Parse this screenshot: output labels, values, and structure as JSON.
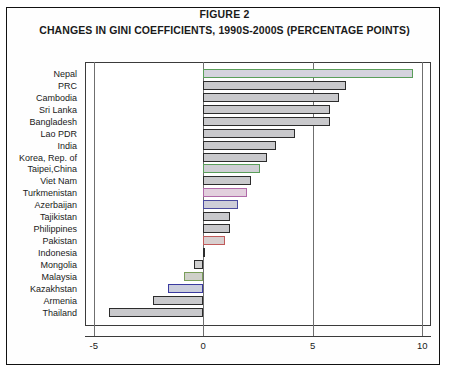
{
  "figure": {
    "label": "FIGURE 2",
    "title": "CHANGES IN GINI COEFFICIENTS, 1990S-2000S (PERCENTAGE POINTS)"
  },
  "axis": {
    "ticks": [
      "-5",
      "0",
      "5",
      "10"
    ],
    "tick_values": [
      -5,
      0,
      5,
      10
    ]
  },
  "chart_data": {
    "type": "bar",
    "orientation": "horizontal",
    "title": "CHANGES IN GINI COEFFICIENTS, 1990S-2000S (PERCENTAGE POINTS)",
    "subtitle": "FIGURE 2",
    "xlabel": "",
    "ylabel": "",
    "xlim": [
      -5.4,
      10.4
    ],
    "grid": true,
    "legend": "none",
    "categories": [
      "Nepal",
      "PRC",
      "Cambodia",
      "Sri Lanka",
      "Bangladesh",
      "Lao PDR",
      "India",
      "Korea, Rep. of",
      "Taipei,China",
      "Viet Nam",
      "Turkmenistan",
      "Azerbaijan",
      "Tajikistan",
      "Philippines",
      "Pakistan",
      "Indonesia",
      "Mongolia",
      "Malaysia",
      "Kazakhstan",
      "Armenia",
      "Thailand"
    ],
    "values": [
      9.6,
      6.5,
      6.2,
      5.8,
      5.8,
      4.2,
      3.3,
      2.9,
      2.6,
      2.2,
      2.0,
      1.6,
      1.2,
      1.2,
      1.0,
      0.1,
      -0.4,
      -0.9,
      -1.6,
      -2.3,
      -4.3
    ],
    "bar_colors": [
      "#d5d3de",
      "#c9c9cc",
      "#c9c9cc",
      "#c9c9cc",
      "#c9c9cc",
      "#c9c9cc",
      "#c9c9cc",
      "#c9c9cc",
      "#cfcfd4",
      "#c9c9cc",
      "#e2cfdd",
      "#cdcdd8",
      "#c9c9cc",
      "#c9c9cc",
      "#d8cfcf",
      "#6b6b6b",
      "#d0d0d0",
      "#cfd0c9",
      "#cbcedd",
      "#c9c9cc",
      "#c9c9cc"
    ],
    "bar_border_colors": [
      "#5a9e5a",
      "#2c2c2c",
      "#2c2c2c",
      "#2c2c2c",
      "#2c2c2c",
      "#2c2c2c",
      "#2c2c2c",
      "#2c2c2c",
      "#5a9e5a",
      "#2c2c2c",
      "#b06aa8",
      "#4a4a9e",
      "#2c2c2c",
      "#2c2c2c",
      "#c05a5a",
      "#2c2c2c",
      "#2c2c2c",
      "#7a9e5a",
      "#3a3aa0",
      "#2c2c2c",
      "#2c2c2c"
    ]
  }
}
